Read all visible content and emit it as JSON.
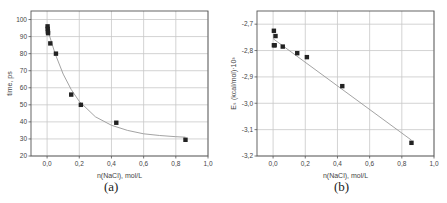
{
  "chart_data": [
    {
      "type": "scatter",
      "caption": "(a)",
      "xlabel": "n(NaCl), mol/L",
      "ylabel": "time, ps",
      "xlim": [
        -0.1,
        1.0
      ],
      "ylim": [
        20,
        105
      ],
      "xticks": [
        "0,0",
        "0,2",
        "0,4",
        "0,6",
        "0,8",
        "1,0"
      ],
      "xtick_values": [
        0.0,
        0.2,
        0.4,
        0.6,
        0.8,
        1.0
      ],
      "yticks": [
        "20",
        "30",
        "40",
        "50",
        "60",
        "70",
        "80",
        "90",
        "100"
      ],
      "ytick_values": [
        20,
        30,
        40,
        50,
        60,
        70,
        80,
        90,
        100
      ],
      "grid": true,
      "series": [
        {
          "name": "data",
          "x": [
            0.003,
            0.004,
            0.005,
            0.006,
            0.02,
            0.055,
            0.15,
            0.21,
            0.43,
            0.86
          ],
          "y": [
            96,
            94.5,
            93,
            92,
            86,
            80,
            56,
            50,
            39.5,
            29.5
          ]
        },
        {
          "name": "fit (exponential decay)",
          "kind": "line",
          "x": [
            0.0,
            0.05,
            0.1,
            0.15,
            0.2,
            0.3,
            0.4,
            0.5,
            0.6,
            0.7,
            0.8,
            0.86
          ],
          "y": [
            95,
            80,
            68,
            59,
            52,
            43,
            38,
            35,
            33,
            32,
            31.3,
            31
          ]
        }
      ]
    },
    {
      "type": "scatter",
      "caption": "(b)",
      "xlabel": "n(NaCl), mol/L",
      "ylabel": "Eₛ (kcal/mol)·10³",
      "xlim": [
        -0.1,
        1.0
      ],
      "ylim": [
        -3.2,
        -2.65
      ],
      "xticks": [
        "0,0",
        "0,2",
        "0,4",
        "0,6",
        "0,8",
        "1,0"
      ],
      "xtick_values": [
        0.0,
        0.2,
        0.4,
        0.6,
        0.8,
        1.0
      ],
      "yticks": [
        "-2,7",
        "-2,8",
        "-2,9",
        "-3,0",
        "-3,1",
        "-3,2"
      ],
      "ytick_values": [
        -2.7,
        -2.8,
        -2.9,
        -3.0,
        -3.1,
        -3.2
      ],
      "grid": true,
      "series": [
        {
          "name": "data",
          "x": [
            0.005,
            0.005,
            0.01,
            0.015,
            0.06,
            0.15,
            0.21,
            0.43,
            0.86
          ],
          "y": [
            -2.725,
            -2.78,
            -2.78,
            -2.745,
            -2.785,
            -2.81,
            -2.825,
            -2.935,
            -3.15
          ]
        },
        {
          "name": "linear fit",
          "kind": "line",
          "x": [
            0.0,
            0.86
          ],
          "y": [
            -2.755,
            -3.14
          ]
        }
      ]
    }
  ]
}
